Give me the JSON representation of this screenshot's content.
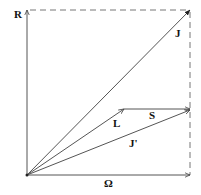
{
  "diagram": {
    "type": "vector-coupling-diagram",
    "labels": {
      "R": "R",
      "J": "J",
      "L": "L",
      "S": "S",
      "J_prime": "J'",
      "Omega": "Ω"
    },
    "colors": {
      "line": "#555555",
      "dashed": "#777777",
      "text": "#111111",
      "background": "#ffffff"
    }
  }
}
